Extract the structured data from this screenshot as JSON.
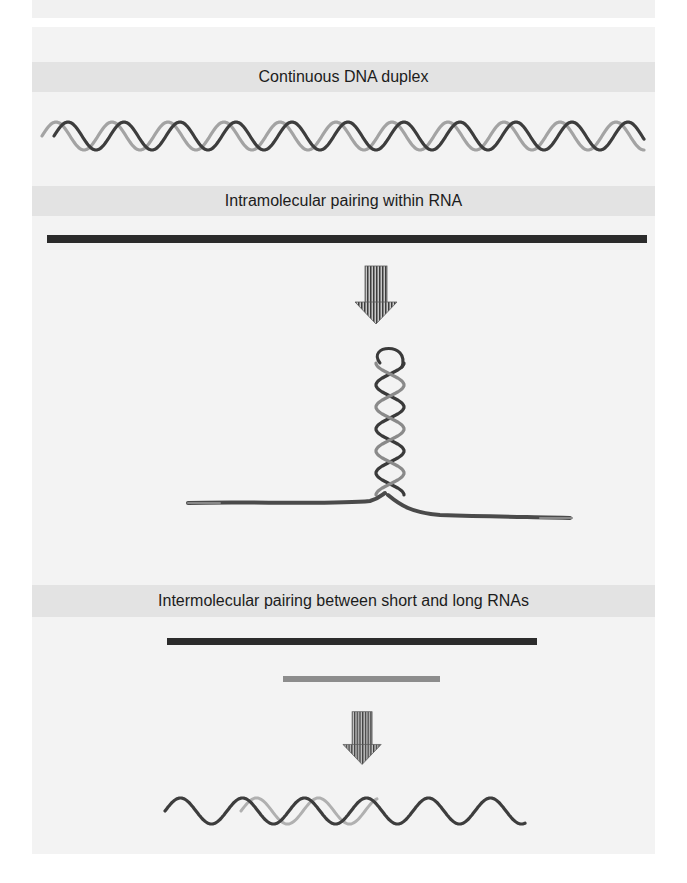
{
  "sections": [
    {
      "title": "Continuous DNA duplex"
    },
    {
      "title": "Intramolecular pairing within RNA"
    },
    {
      "title": "Intermolecular pairing between short and long RNAs"
    }
  ],
  "colors": {
    "panel_bg": "#f3f3f3",
    "band_bg": "#e3e3e3",
    "long_rna": "#2b2b2b",
    "short_rna": "#8c8c8c",
    "strand_dark": "#3a3a3a",
    "strand_light": "#a0a0a0"
  },
  "icons": {
    "arrow": "down-arrow-icon",
    "dna": "double-helix-icon",
    "hairpin": "rna-hairpin-icon"
  }
}
